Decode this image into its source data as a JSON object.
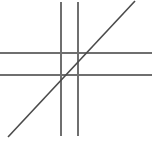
{
  "figure": {
    "title": "",
    "width": 157,
    "height": 143,
    "background_color": "#ffffff"
  },
  "chart_data": {
    "type": "line",
    "title": "",
    "subtitle": "",
    "xlabel": "",
    "ylabel": "",
    "xlim": [
      0,
      157
    ],
    "ylim": [
      0,
      143
    ],
    "grid": false,
    "legend": "none",
    "annotations": [],
    "tick_labels": {
      "x": [],
      "y": []
    },
    "series": [
      {
        "name": "vertical-line-left",
        "orientation": "vertical",
        "color": "#6f6f6f",
        "width": 1.6,
        "x": [
          61,
          61
        ],
        "y": [
          2,
          136
        ]
      },
      {
        "name": "vertical-line-right",
        "orientation": "vertical",
        "color": "#6f6f6f",
        "width": 1.6,
        "x": [
          78,
          78
        ],
        "y": [
          2,
          136
        ]
      },
      {
        "name": "horizontal-line-upper",
        "orientation": "horizontal",
        "color": "#6f6f6f",
        "width": 1.6,
        "x": [
          0,
          152
        ],
        "y": [
          53,
          53
        ]
      },
      {
        "name": "horizontal-line-lower",
        "orientation": "horizontal",
        "color": "#6f6f6f",
        "width": 1.6,
        "x": [
          0,
          152
        ],
        "y": [
          75,
          75
        ]
      },
      {
        "name": "diagonal-line",
        "orientation": "diagonal",
        "color": "#4a4a4a",
        "width": 1.6,
        "x": [
          8,
          135
        ],
        "y": [
          137,
          1
        ]
      }
    ],
    "intersections": [
      {
        "name": "diagonal-meets-right-vertical-and-upper-horizontal",
        "x": 78,
        "y": 53
      },
      {
        "name": "diagonal-meets-left-vertical-and-lower-horizontal",
        "x": 61,
        "y": 75
      }
    ]
  },
  "colors": {
    "axis_line": "#6f6f6f",
    "diagonal_line": "#4a4a4a",
    "background": "#ffffff"
  }
}
